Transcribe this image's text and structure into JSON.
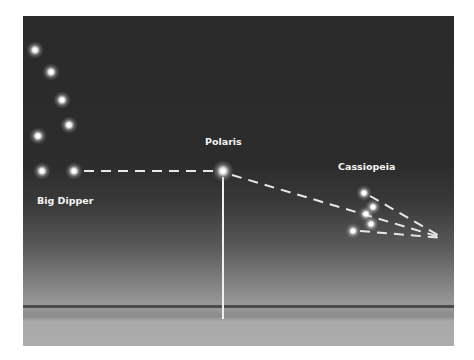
{
  "labels": {
    "big_dipper": "Big Dipper",
    "polaris": "Polaris",
    "cassiopeia": "Cassiopeia"
  },
  "colors": {
    "sky_top": "#2a2a2a",
    "sky_bottom": "#9a9a9a",
    "ground": "#acacac",
    "star": "#ffffff",
    "line": "#e8e8e8"
  },
  "stars": {
    "big_dipper": [
      {
        "x": 35,
        "y": 50
      },
      {
        "x": 51,
        "y": 72
      },
      {
        "x": 62,
        "y": 100
      },
      {
        "x": 69,
        "y": 125
      },
      {
        "x": 38,
        "y": 136
      },
      {
        "x": 42,
        "y": 171
      },
      {
        "x": 74,
        "y": 171
      }
    ],
    "polaris": {
      "x": 223,
      "y": 171
    },
    "cassiopeia": [
      {
        "x": 364,
        "y": 193
      },
      {
        "x": 373,
        "y": 207
      },
      {
        "x": 366,
        "y": 214
      },
      {
        "x": 371,
        "y": 224
      },
      {
        "x": 353,
        "y": 231
      }
    ]
  },
  "horizon_y": 307
}
